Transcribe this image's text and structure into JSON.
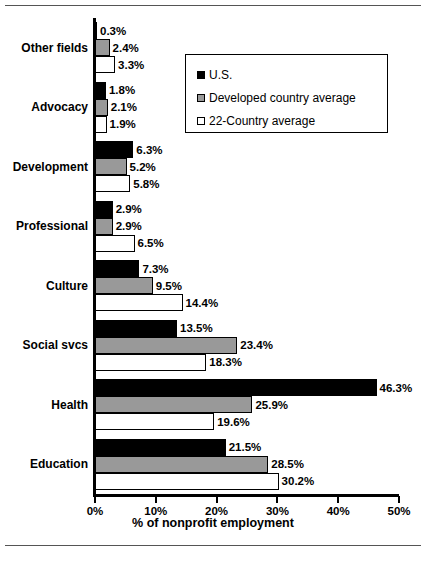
{
  "chart_data": {
    "type": "bar",
    "orientation": "horizontal",
    "title": "",
    "xlabel": "% of nonprofit employment",
    "ylabel": "",
    "xlim": [
      0,
      50
    ],
    "xticks": [
      "0%",
      "10%",
      "20%",
      "30%",
      "40%",
      "50%"
    ],
    "xtick_values": [
      0,
      10,
      20,
      30,
      40,
      50
    ],
    "grid": false,
    "legend_position": "upper-right-inside",
    "categories": [
      "Other fields",
      "Advocacy",
      "Development",
      "Professional",
      "Culture",
      "Social svcs",
      "Health",
      "Education"
    ],
    "series": [
      {
        "name": "U.S.",
        "color": "#000000",
        "values": [
          0.3,
          1.8,
          6.3,
          2.9,
          7.3,
          13.5,
          46.3,
          21.5
        ],
        "labels": [
          "0.3%",
          "1.8%",
          "6.3%",
          "2.9%",
          "7.3%",
          "13.5%",
          "46.3%",
          "21.5%"
        ]
      },
      {
        "name": "Developed country average",
        "color": "#999999",
        "values": [
          2.4,
          2.1,
          5.2,
          2.9,
          9.5,
          23.4,
          25.9,
          28.5
        ],
        "labels": [
          "2.4%",
          "2.1%",
          "5.2%",
          "2.9%",
          "9.5%",
          "23.4%",
          "25.9%",
          "28.5%"
        ]
      },
      {
        "name": "22-Country average",
        "color": "#ffffff",
        "values": [
          3.3,
          1.9,
          5.8,
          6.5,
          14.4,
          18.3,
          19.6,
          30.2
        ],
        "labels": [
          "3.3%",
          "1.9%",
          "5.8%",
          "6.5%",
          "14.4%",
          "18.3%",
          "19.6%",
          "30.2%"
        ]
      }
    ]
  },
  "legend": {
    "items": [
      {
        "label": "U.S."
      },
      {
        "label": "Developed country average"
      },
      {
        "label": "22-Country average"
      }
    ]
  }
}
